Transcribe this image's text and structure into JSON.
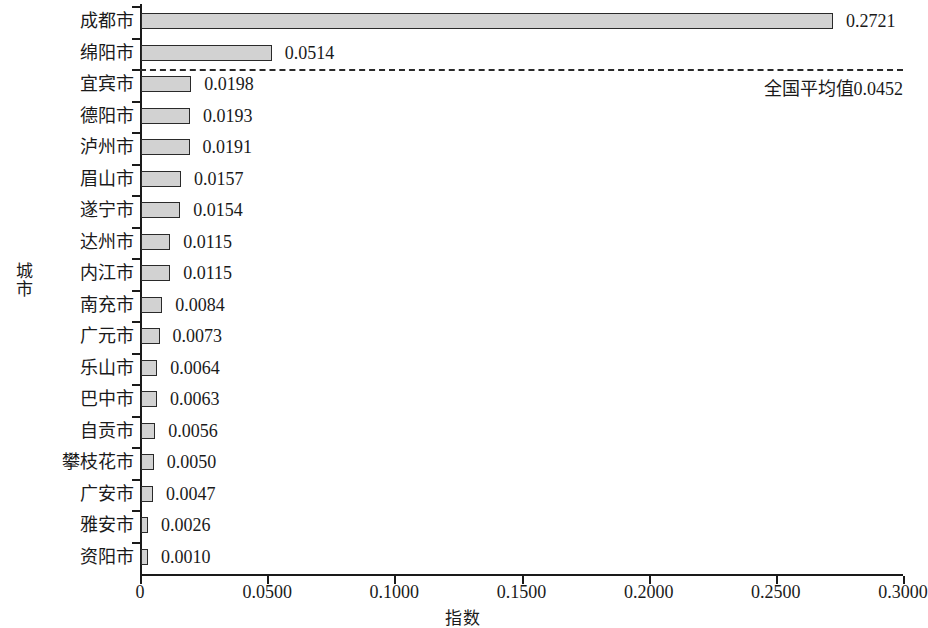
{
  "chart_data": {
    "type": "bar",
    "orientation": "horizontal",
    "title": "",
    "xlabel": "指数",
    "ylabel": "城市",
    "xlim": [
      0,
      0.3
    ],
    "grid": false,
    "legend": null,
    "categories": [
      "成都市",
      "绵阳市",
      "宜宾市",
      "德阳市",
      "泸州市",
      "眉山市",
      "遂宁市",
      "达州市",
      "内江市",
      "南充市",
      "广元市",
      "乐山市",
      "巴中市",
      "自贡市",
      "攀枝花市",
      "广安市",
      "雅安市",
      "资阳市"
    ],
    "values": [
      0.2721,
      0.0514,
      0.0198,
      0.0193,
      0.0191,
      0.0157,
      0.0154,
      0.0115,
      0.0115,
      0.0084,
      0.0073,
      0.0064,
      0.0063,
      0.0056,
      0.005,
      0.0047,
      0.0026,
      0.001
    ],
    "value_labels": [
      "0.2721",
      "0.0514",
      "0.0198",
      "0.0193",
      "0.0191",
      "0.0157",
      "0.0154",
      "0.0115",
      "0.0115",
      "0.0084",
      "0.0073",
      "0.0064",
      "0.0063",
      "0.0056",
      "0.0050",
      "0.0047",
      "0.0026",
      "0.0010"
    ],
    "x_ticks": [
      0,
      0.05,
      0.1,
      0.15,
      0.2,
      0.25,
      0.3
    ],
    "x_tick_labels": [
      "0",
      "0.0500",
      "0.1000",
      "0.1500",
      "0.2000",
      "0.2500",
      "0.3000"
    ],
    "annotations": [
      {
        "name": "national-average-line",
        "label": "全国平均值0.0452",
        "value": 0.0452,
        "style": "dashed-horizontal",
        "after_category_index": 1
      }
    ],
    "colors": {
      "bar_fill": "#d2d2d2",
      "bar_stroke": "#2a2a2a",
      "axis": "#1a1a1a",
      "text": "#1a1a1a"
    }
  }
}
